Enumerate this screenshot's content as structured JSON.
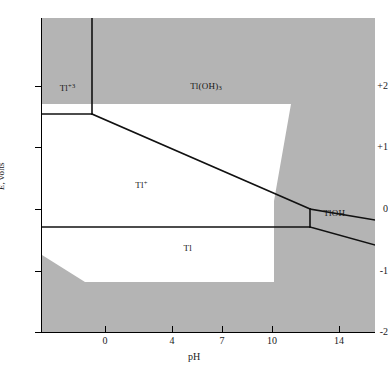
{
  "figure": {
    "kind": "pourbaix-diagram",
    "element": "Tl",
    "background_color": "#b4b4b4",
    "stability_region_color": "#ffffff",
    "line_color": "#000000"
  },
  "axes": {
    "x": {
      "title": "pH",
      "ticks": [
        0,
        4,
        7,
        10,
        14
      ],
      "tick_labels": [
        "0",
        "4",
        "7",
        "10",
        "14"
      ],
      "min": -2.7,
      "max": 17.2
    },
    "y": {
      "title_symbol": "E",
      "title_rest": ", volts",
      "ticks": [
        2,
        1,
        0,
        -1,
        -2
      ],
      "tick_labels": [
        "+2",
        "+1",
        "0",
        "-1",
        "-2"
      ],
      "min": -2.15,
      "max": 2.9
    }
  },
  "regions": [
    {
      "name": "thallium-III-ion",
      "label_html": "Tl<sup>+3</sup>",
      "x_pct": 5.3,
      "y_pct": 22.3
    },
    {
      "name": "thallium-hydroxide-3",
      "label_html": "Tl(OH)<sub>3</sub>",
      "x_pct": 44.5,
      "y_pct": 22.0
    },
    {
      "name": "thallium-I-ion",
      "label_html": "Tl<sup>+</sup>",
      "x_pct": 28.0,
      "y_pct": 52.5
    },
    {
      "name": "thallium-hydroxide-1",
      "label_html": "TlOH",
      "x_pct": 84.5,
      "y_pct": 61.5
    },
    {
      "name": "thallium-metal",
      "label_html": "Tl",
      "x_pct": 42.5,
      "y_pct": 72.5
    }
  ],
  "chart_data": {
    "type": "line",
    "title": "",
    "xlabel": "pH",
    "ylabel": "E, volts",
    "xlim": [
      -2.7,
      17.2
    ],
    "ylim": [
      -2.15,
      2.9
    ],
    "xticks": [
      0,
      4,
      7,
      10,
      14
    ],
    "yticks": [
      2,
      1,
      0,
      -1,
      -2
    ],
    "grid": false,
    "legend": "none",
    "annotations": [
      {
        "text": "Tl+3",
        "pH": -1.6,
        "E": 1.72
      },
      {
        "text": "Tl(OH)3",
        "pH": 6.4,
        "E": 1.75
      },
      {
        "text": "Tl+",
        "pH": 2.5,
        "E": 0.22
      },
      {
        "text": "TlOH",
        "pH": 14.5,
        "E": -0.22
      },
      {
        "text": "Tl",
        "pH": 6.0,
        "E": -0.58
      }
    ],
    "series": [
      {
        "name": "Tl+3 / Tl(OH)3 vertical boundary",
        "points": [
          [
            -0.8,
            2.9
          ],
          [
            -0.8,
            1.32
          ]
        ]
      },
      {
        "name": "Tl+3 / Tl+ horizontal boundary",
        "points": [
          [
            -2.7,
            1.32
          ],
          [
            -0.8,
            1.32
          ]
        ]
      },
      {
        "name": "Tl(OH)3 / Tl+ sloping boundary",
        "points": [
          [
            -0.8,
            1.32
          ],
          [
            13.2,
            -0.06
          ]
        ]
      },
      {
        "name": "Tl+ / TlOH vertical boundary",
        "points": [
          [
            13.2,
            -0.06
          ],
          [
            13.2,
            -0.35
          ]
        ]
      },
      {
        "name": "TlOH / Tl(OH)3 extension",
        "points": [
          [
            13.2,
            -0.06
          ],
          [
            17.2,
            -0.23
          ]
        ]
      },
      {
        "name": "Tl+ / Tl metal horizontal boundary",
        "points": [
          [
            -2.7,
            -0.35
          ],
          [
            13.2,
            -0.35
          ]
        ]
      },
      {
        "name": "TlOH / Tl metal sloping boundary",
        "points": [
          [
            13.2,
            -0.35
          ],
          [
            17.2,
            -0.62
          ]
        ]
      }
    ],
    "water_stability_polygon": {
      "name": "white stability field of water",
      "vertices": [
        [
          -2.7,
          1.52
        ],
        [
          12.6,
          1.52
        ],
        [
          11.6,
          -0.05
        ],
        [
          11.6,
          -1.37
        ],
        [
          -1.05,
          -1.37
        ],
        [
          -2.7,
          -0.47
        ]
      ]
    }
  }
}
